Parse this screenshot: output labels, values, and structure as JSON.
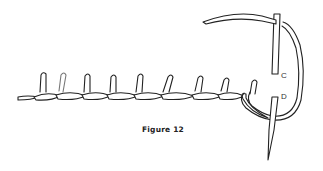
{
  "figure": {
    "caption": "Figure 12",
    "labels": {
      "c": "C",
      "d": "D"
    },
    "stroke_color": "#222222",
    "background": "#ffffff",
    "stitch_count": 9
  }
}
